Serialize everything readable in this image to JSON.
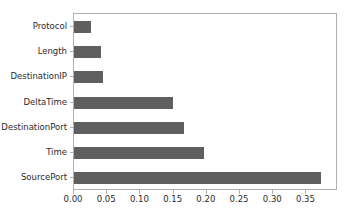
{
  "chart_data": {
    "type": "bar",
    "orientation": "horizontal",
    "title": "",
    "xlabel": "",
    "ylabel": "",
    "categories": [
      "Protocol",
      "Length",
      "DestinationIP",
      "DeltaTime",
      "DestinationPort",
      "Time",
      "SourcePort"
    ],
    "values": [
      0.025,
      0.04,
      0.044,
      0.149,
      0.166,
      0.195,
      0.372
    ],
    "xlim": [
      0.0,
      0.3975
    ],
    "xticks": [
      0.0,
      0.05,
      0.1,
      0.15,
      0.2,
      0.25,
      0.3,
      0.35
    ],
    "xticklabels": [
      "0.00",
      "0.05",
      "0.10",
      "0.15",
      "0.20",
      "0.25",
      "0.30",
      "0.35"
    ],
    "grid": false,
    "legend": null,
    "bar_color": "#5f5f5f",
    "background_color": "#ffffff",
    "spine_color": "#b0b0b0"
  }
}
